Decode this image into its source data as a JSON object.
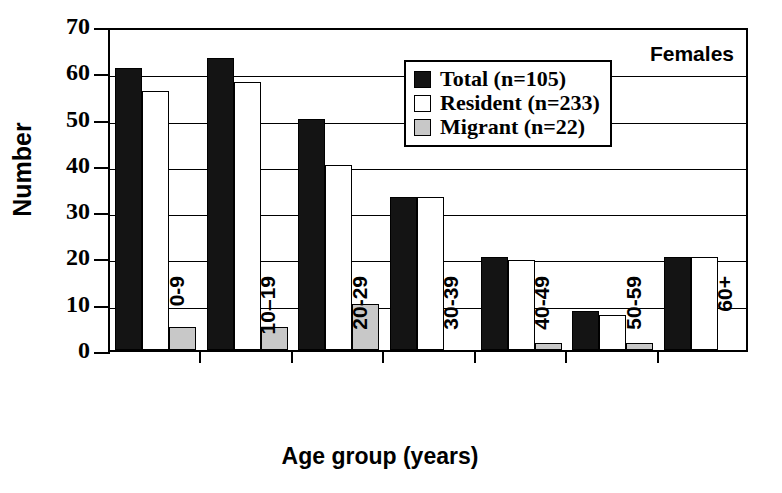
{
  "chart_data": {
    "type": "bar",
    "title": "",
    "panel_label": "Females",
    "xlabel": "Age group (years)",
    "ylabel": "Number",
    "categories": [
      "0-9",
      "10–19",
      "20-29",
      "30-39",
      "40-49",
      "50-59",
      "60+"
    ],
    "ylim": [
      0,
      70
    ],
    "yticks": [
      0,
      10,
      20,
      30,
      40,
      50,
      60,
      70
    ],
    "grid": "horizontal",
    "legend_position": "upper-right-inside",
    "series": [
      {
        "name": "Total (n=105)",
        "key": "total",
        "color": "#141414",
        "values": [
          61,
          63,
          50,
          33,
          20,
          8.5,
          20
        ]
      },
      {
        "name": "Resident (n=233)",
        "key": "resident",
        "color": "#ffffff",
        "values": [
          56,
          58,
          40,
          33,
          19.5,
          7.5,
          20
        ]
      },
      {
        "name": "Migrant (n=22)",
        "key": "migrant",
        "color": "#c8c8c8",
        "values": [
          5,
          5,
          10,
          0,
          1.5,
          1.5,
          0
        ]
      }
    ]
  },
  "axis": {
    "ytick_labels": [
      "70",
      "60",
      "50",
      "40",
      "30",
      "20",
      "10",
      "0"
    ]
  },
  "legend": {
    "items": [
      {
        "label": "Total (n=105)",
        "key": "total"
      },
      {
        "label": "Resident (n=233)",
        "key": "resident"
      },
      {
        "label": "Migrant (n=22)",
        "key": "migrant"
      }
    ]
  }
}
